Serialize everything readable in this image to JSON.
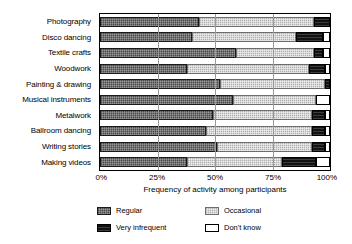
{
  "chart_data": {
    "type": "bar",
    "orientation": "horizontal",
    "stacked": true,
    "normalized": true,
    "title": "",
    "xlabel": "Frequency of activity among participants",
    "ylabel": "",
    "xlim": [
      0,
      100
    ],
    "xticks": [
      0,
      25,
      50,
      75,
      100
    ],
    "xticklabels": [
      "0%",
      "25%",
      "50%",
      "75%",
      "100%"
    ],
    "grid": true,
    "grid_axis": "x",
    "legend_position": "below",
    "categories": [
      "Photography",
      "Disco dancing",
      "Textile crafts",
      "Woodwork",
      "Painting & drawing",
      "Musical instruments",
      "Metalwork",
      "Ballroom dancing",
      "Writing stories",
      "Making videos"
    ],
    "series": [
      {
        "name": "Regular",
        "color": "#636363",
        "values": [
          43,
          40,
          59,
          38,
          52,
          58,
          49,
          46,
          51,
          38
        ]
      },
      {
        "name": "Occasional",
        "color": "#c9c9c9",
        "values": [
          50,
          45,
          34,
          53,
          46,
          36,
          43,
          46,
          41,
          41
        ]
      },
      {
        "name": "Very infrequent",
        "color": "#121212",
        "values": [
          7,
          12,
          4,
          7,
          2,
          0,
          6,
          6,
          6,
          15
        ]
      },
      {
        "name": "Don't know",
        "color": "#ffffff",
        "values": [
          0,
          3,
          3,
          2,
          0,
          6,
          2,
          2,
          2,
          6
        ]
      }
    ]
  },
  "legend": {
    "items": [
      {
        "label": "Regular",
        "swatch": "swatch-regular"
      },
      {
        "label": "Occasional",
        "swatch": "swatch-occasional"
      },
      {
        "label": "Very infrequent",
        "swatch": "swatch-very-infrequent"
      },
      {
        "label": "Don't know",
        "swatch": "swatch-dont-know"
      }
    ]
  }
}
